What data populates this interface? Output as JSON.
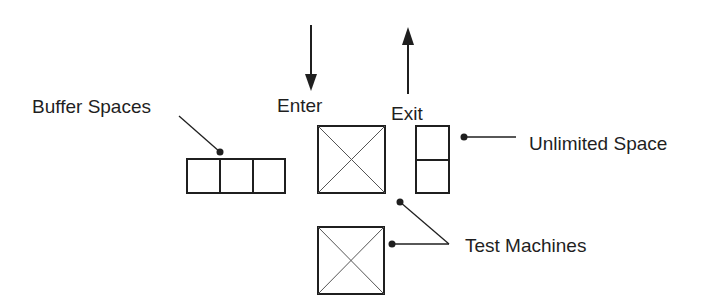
{
  "diagram": {
    "type": "layout-schematic",
    "colors": {
      "stroke": "#1f1f1f",
      "background": "#ffffff"
    },
    "labels": {
      "buffer_spaces": "Buffer Spaces",
      "enter": "Enter",
      "exit": "Exit",
      "unlimited_space": "Unlimited Space",
      "test_machines": "Test Machines"
    },
    "elements": {
      "buffer_cells": 3,
      "unlimited_cells": 2,
      "test_machines": 2,
      "arrows": [
        {
          "name": "enter-arrow",
          "direction": "down"
        },
        {
          "name": "exit-arrow",
          "direction": "up"
        }
      ]
    }
  }
}
